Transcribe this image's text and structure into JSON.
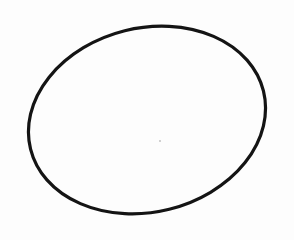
{
  "image": {
    "description": "hand-drawn ellipse sketch on white paper",
    "background": "#fdfdfd",
    "stroke_color": "#141414"
  },
  "shapes": [
    {
      "type": "ellipse",
      "cx": 147,
      "cy": 120,
      "rx": 120,
      "ry": 92,
      "rotation_deg": -14,
      "stroke_width": 3.2
    }
  ]
}
